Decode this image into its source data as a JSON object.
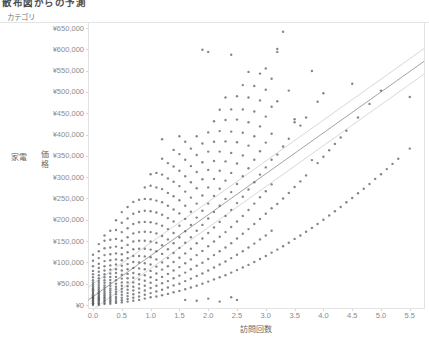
{
  "title": "散布図からの予測",
  "category_header": "カテゴリ",
  "row_label": "家電",
  "colors": {
    "point": "#53575c",
    "trend_line": "#a3a3a3",
    "confidence_band": "#d8d8d8",
    "axis_text": "#8b8b8b",
    "border": "#e3e3e3"
  },
  "chart_data": {
    "type": "scatter",
    "title": "散布図からの予測",
    "xlabel": "訪問回数",
    "ylabel": "価格",
    "category": "家電",
    "grid": false,
    "xlim": [
      -0.09,
      5.75
    ],
    "ylim": [
      0,
      650000
    ],
    "x_ticks": [
      "0.0",
      "0.5",
      "1.0",
      "1.5",
      "2.0",
      "2.5",
      "3.0",
      "3.5",
      "4.0",
      "4.5",
      "5.0",
      "5.5"
    ],
    "x_tick_values": [
      0.0,
      0.5,
      1.0,
      1.5,
      2.0,
      2.5,
      3.0,
      3.5,
      4.0,
      4.5,
      5.0,
      5.5
    ],
    "y_ticks": [
      "¥0",
      "¥50,000",
      "¥100,000",
      "¥150,000",
      "¥200,000",
      "¥250,000",
      "¥300,000",
      "¥350,000",
      "¥400,000",
      "¥450,000",
      "¥500,000",
      "¥550,000",
      "¥600,000",
      "¥650,000"
    ],
    "y_tick_values": [
      0,
      50000,
      100000,
      150000,
      200000,
      250000,
      300000,
      350000,
      400000,
      450000,
      500000,
      550000,
      600000,
      650000
    ],
    "trend": {
      "x_start": -0.09,
      "value_start": 11000,
      "x_end": 5.75,
      "value_end": 572000,
      "band_offset": 30000
    },
    "columns": [
      {
        "x": 0.0,
        "ys": [
          0,
          2000,
          4000,
          5000,
          8000,
          10000,
          12000,
          14000,
          16000,
          18000,
          20000,
          22000,
          25000,
          28000,
          31000,
          34000,
          37000,
          40000,
          44000,
          48000,
          53000,
          58000,
          65000,
          72000,
          80000,
          91000,
          104000,
          118000
        ]
      },
      {
        "x": 0.1,
        "ys": [
          0,
          3000,
          5000,
          8000,
          11000,
          13000,
          16000,
          18000,
          21000,
          24000,
          27000,
          30000,
          34000,
          38000,
          42000,
          47000,
          52000,
          57000,
          63000,
          70000,
          78000,
          87000,
          97000,
          110000,
          126000,
          143000
        ]
      },
      {
        "x": 0.2,
        "ys": [
          2000,
          5000,
          9000,
          12000,
          16000,
          19000,
          23000,
          27000,
          31000,
          36000,
          41000,
          46000,
          52000,
          58000,
          65000,
          72000,
          81000,
          91000,
          103000,
          117000,
          133000,
          151000,
          163000
        ]
      },
      {
        "x": 0.3,
        "ys": [
          3000,
          7000,
          11000,
          15000,
          19000,
          24000,
          29000,
          34000,
          39000,
          45000,
          52000,
          59000,
          66000,
          74000,
          83000,
          93000,
          105000,
          119000,
          135000,
          153000,
          174000
        ]
      },
      {
        "x": 0.4,
        "ys": [
          5000,
          9000,
          14000,
          19000,
          25000,
          31000,
          37000,
          43000,
          50000,
          58000,
          66000,
          75000,
          84000,
          95000,
          107000,
          121000,
          137000,
          155000,
          176000,
          199000
        ]
      },
      {
        "x": 0.5,
        "ys": [
          6000,
          11000,
          17000,
          24000,
          31000,
          38000,
          45000,
          53000,
          62000,
          71000,
          81000,
          92000,
          105000,
          119000,
          134000,
          151000,
          171000,
          193000,
          218000
        ]
      },
      {
        "x": 0.6,
        "ys": [
          8000,
          14000,
          21000,
          28000,
          36000,
          44000,
          53000,
          63000,
          73000,
          84000,
          96000,
          110000,
          124000,
          141000,
          159000,
          180000,
          203000,
          230000
        ]
      },
      {
        "x": 0.7,
        "ys": [
          10000,
          17000,
          25000,
          34000,
          43000,
          53000,
          64000,
          75000,
          87000,
          101000,
          115000,
          131000,
          149000,
          168000,
          190000,
          214000,
          242000
        ]
      },
      {
        "x": 0.8,
        "ys": [
          12000,
          20000,
          29000,
          39000,
          49000,
          60000,
          72000,
          86000,
          100000,
          115000,
          132000,
          151000,
          171000,
          194000,
          219000,
          247000
        ]
      },
      {
        "x": 0.9,
        "ys": [
          15000,
          24000,
          34000,
          45000,
          57000,
          70000,
          84000,
          98000,
          114000,
          132000,
          151000,
          172000,
          195000,
          221000,
          249000,
          276000
        ]
      },
      {
        "x": 1.0,
        "ys": [
          18000,
          28000,
          40000,
          52000,
          65000,
          80000,
          95000,
          112000,
          130000,
          149000,
          171000,
          194000,
          220000,
          248000,
          280000,
          307000
        ]
      },
      {
        "x": 1.1,
        "ys": [
          20000,
          32000,
          45000,
          59000,
          74000,
          90000,
          107000,
          126000,
          146000,
          168000,
          191000,
          217000,
          245000,
          276000,
          310000
        ]
      },
      {
        "x": 1.2,
        "ys": [
          23000,
          36000,
          51000,
          66000,
          83000,
          100000,
          120000,
          140000,
          162000,
          186000,
          212000,
          241000,
          272000,
          306000,
          343000,
          389000
        ]
      },
      {
        "x": 1.3,
        "ys": [
          26000,
          41000,
          56000,
          73000,
          91000,
          110000,
          131000,
          154000,
          178000,
          204000,
          233000,
          263000,
          297000,
          333000
        ]
      },
      {
        "x": 1.4,
        "ys": [
          30000,
          46000,
          63000,
          81000,
          101000,
          122000,
          145000,
          169000,
          196000,
          224000,
          255000,
          289000,
          325000,
          364000
        ]
      },
      {
        "x": 1.5,
        "ys": [
          33000,
          50000,
          69000,
          89000,
          111000,
          134000,
          159000,
          186000,
          215000,
          246000,
          279000,
          315000,
          354000,
          396000
        ]
      },
      {
        "x": 1.6,
        "ys": [
          12000,
          37000,
          56000,
          76000,
          98000,
          121000,
          146000,
          173000,
          202000,
          233000,
          266000,
          302000,
          341000,
          383000
        ]
      },
      {
        "x": 1.7,
        "ys": [
          41000,
          62000,
          84000,
          107000,
          132000,
          159000,
          188000,
          219000,
          252000,
          288000,
          326000,
          367000
        ]
      },
      {
        "x": 1.8,
        "ys": [
          10000,
          45000,
          68000,
          92000,
          117000,
          145000,
          174000,
          205000,
          238000,
          274000,
          312000,
          352000,
          396000
        ]
      },
      {
        "x": 1.9,
        "ys": [
          50000,
          74000,
          99000,
          127000,
          156000,
          188000,
          221000,
          257000,
          295000,
          335000,
          379000,
          599000
        ]
      },
      {
        "x": 2.0,
        "ys": [
          15000,
          55000,
          81000,
          108000,
          138000,
          169000,
          203000,
          238000,
          276000,
          317000,
          360000,
          405000,
          594000
        ]
      },
      {
        "x": 2.1,
        "ys": [
          60000,
          88000,
          117000,
          149000,
          182000,
          218000,
          256000,
          296000,
          338000,
          383000,
          431000
        ]
      },
      {
        "x": 2.2,
        "ys": [
          8000,
          65000,
          95000,
          126000,
          160000,
          195000,
          233000,
          273000,
          315000,
          360000,
          408000,
          458000
        ]
      },
      {
        "x": 2.3,
        "ys": [
          70000,
          102000,
          135000,
          171000,
          209000,
          249000,
          292000,
          337000,
          384000,
          434000,
          487000
        ]
      },
      {
        "x": 2.4,
        "ys": [
          18000,
          76000,
          110000,
          145000,
          183000,
          223000,
          265000,
          310000,
          357000,
          407000,
          459000,
          587000
        ]
      },
      {
        "x": 2.5,
        "ys": [
          12000,
          82000,
          118000,
          156000,
          196000,
          239000,
          284000,
          332000,
          382000,
          435000,
          490000
        ]
      },
      {
        "x": 2.6,
        "ys": [
          88000,
          126000,
          167000,
          209000,
          254000,
          302000,
          351000,
          404000,
          459000,
          516000
        ]
      },
      {
        "x": 2.7,
        "ys": [
          94000,
          135000,
          178000,
          223000,
          271000,
          321000,
          374000,
          429000,
          487000,
          547000
        ]
      },
      {
        "x": 2.8,
        "ys": [
          101000,
          144000,
          190000,
          238000,
          288000,
          341000,
          396000,
          454000,
          514000
        ]
      },
      {
        "x": 2.9,
        "ys": [
          108000,
          154000,
          202000,
          253000,
          306000,
          361000,
          419000,
          480000,
          543000
        ]
      },
      {
        "x": 3.0,
        "ys": [
          115000,
          163000,
          214000,
          267000,
          323000,
          381000,
          442000,
          505000,
          555000
        ]
      },
      {
        "x": 3.1,
        "ys": [
          123000,
          174000,
          227000,
          283000,
          341000,
          402000,
          465000,
          531000
        ]
      },
      {
        "x": 3.2,
        "ys": [
          130000,
          237000,
          353000,
          478000,
          594000,
          601000
        ]
      },
      {
        "x": 3.3,
        "ys": [
          138000,
          250000,
          372000,
          641000
        ]
      },
      {
        "x": 3.4,
        "ys": [
          146000,
          263000,
          390000,
          503000
        ]
      },
      {
        "x": 3.5,
        "ys": [
          155000,
          277000,
          429000,
          436000
        ]
      },
      {
        "x": 3.6,
        "ys": [
          163000,
          290000,
          421000
        ]
      },
      {
        "x": 3.7,
        "ys": [
          172000,
          304000,
          440000
        ]
      },
      {
        "x": 3.8,
        "ys": [
          181000,
          340000,
          549000
        ]
      },
      {
        "x": 3.9,
        "ys": [
          190000,
          333000,
          477000
        ]
      },
      {
        "x": 4.0,
        "ys": [
          200000,
          348000,
          497000
        ]
      },
      {
        "x": 4.1,
        "ys": [
          210000,
          363000
        ]
      },
      {
        "x": 4.2,
        "ys": [
          220000,
          378000
        ]
      },
      {
        "x": 4.3,
        "ys": [
          230000,
          393000
        ]
      },
      {
        "x": 4.4,
        "ys": [
          241000,
          409000
        ]
      },
      {
        "x": 4.5,
        "ys": [
          251000,
          519000
        ]
      },
      {
        "x": 4.6,
        "ys": [
          262000,
          440000
        ]
      },
      {
        "x": 4.7,
        "ys": [
          273000
        ]
      },
      {
        "x": 4.8,
        "ys": [
          284000,
          472000
        ]
      },
      {
        "x": 4.9,
        "ys": [
          296000
        ]
      },
      {
        "x": 5.0,
        "ys": [
          307000,
          503000
        ]
      },
      {
        "x": 5.1,
        "ys": [
          319000
        ]
      },
      {
        "x": 5.2,
        "ys": [
          331000
        ]
      },
      {
        "x": 5.3,
        "ys": [
          343000
        ]
      },
      {
        "x": 5.5,
        "ys": [
          367000,
          488000
        ]
      }
    ]
  }
}
